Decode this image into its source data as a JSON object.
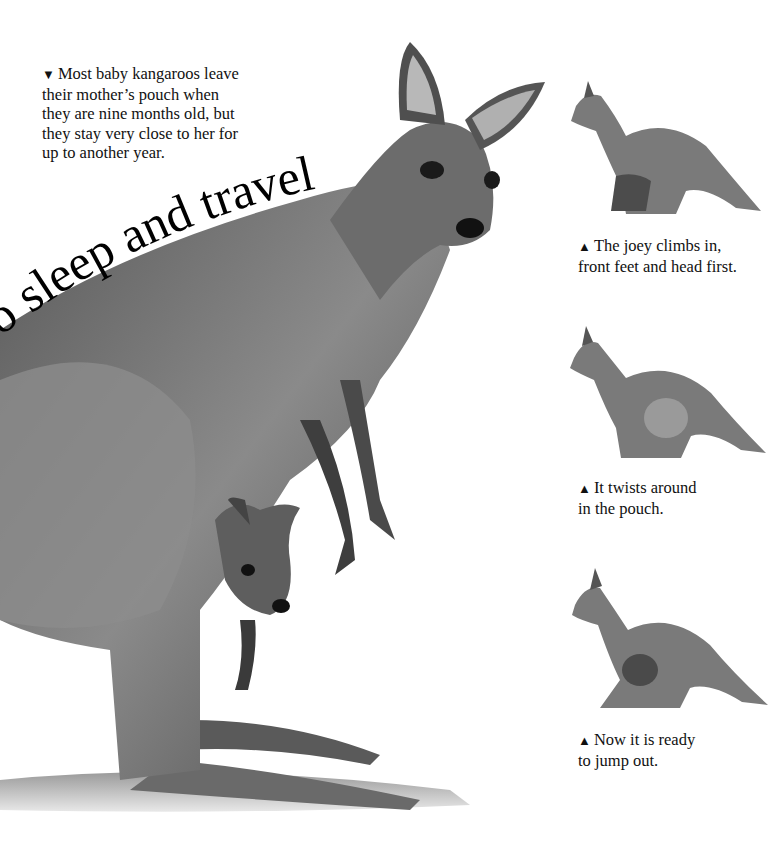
{
  "headline": {
    "text": "to sleep and travel",
    "style": "curved serif title following the kangaroo's back"
  },
  "intro_caption": {
    "marker": "▼",
    "text": "Most baby kangaroos leave their mother’s pouch when they are nine months old, but they stay very close to her for up to another year.",
    "lines": [
      "Most baby kangaroos leave",
      "their mother’s pouch when",
      "they are nine months old, but",
      "they stay very close to her for",
      "up to another year."
    ]
  },
  "illustrations": {
    "main": {
      "subject": "adult grey kangaroo standing with joey peeking from pouch",
      "tone": "graphite pencil"
    },
    "sequence": [
      {
        "step": 1,
        "subject": "joey climbing into pouch",
        "caption": {
          "marker": "▲",
          "lines": [
            "The joey climbs in,",
            "front feet and head first."
          ]
        }
      },
      {
        "step": 2,
        "subject": "joey twisting around inside pouch",
        "caption": {
          "marker": "▲",
          "lines": [
            "It twists around",
            "in the pouch."
          ]
        }
      },
      {
        "step": 3,
        "subject": "joey head out of pouch, ready",
        "caption": {
          "marker": "▲",
          "lines": [
            "Now it is ready",
            "to jump out."
          ]
        }
      }
    ]
  },
  "colors": {
    "background": "#ffffff",
    "text": "#111111",
    "fur_dark": "#3a3a3a",
    "fur_mid": "#7a7a7a",
    "fur_light": "#bdbdbd"
  }
}
